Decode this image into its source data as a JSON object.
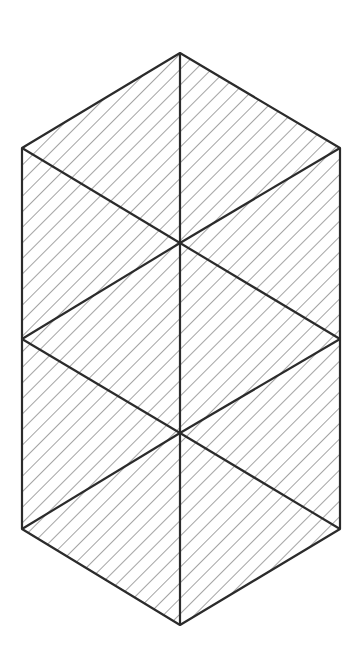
{
  "diagram": {
    "type": "hatched-hexagonal-prism",
    "stroke_color": "#2b2b2b",
    "hatch_color": "#555555",
    "background": "#ffffff",
    "vertices": {
      "top": [
        180,
        53
      ],
      "upper_left": [
        22,
        148
      ],
      "upper_right": [
        340,
        148
      ],
      "upper_center": [
        180,
        243
      ],
      "mid_left": [
        22,
        339
      ],
      "mid_right": [
        340,
        339
      ],
      "lower_center": [
        180,
        433
      ],
      "lower_left": [
        22,
        529
      ],
      "lower_right": [
        340,
        529
      ],
      "bottom": [
        180,
        625
      ]
    },
    "hatch_spacing": 11
  }
}
